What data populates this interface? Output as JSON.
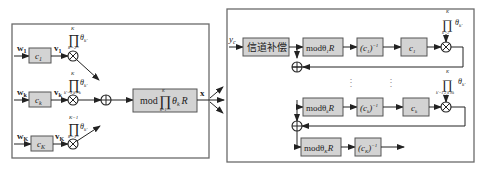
{
  "diagram": {
    "left_panel": {
      "inputs": [
        "w",
        "w",
        "w"
      ],
      "input_subscripts": [
        "1",
        "k",
        "K"
      ],
      "encoders": [
        "c",
        "c",
        "c"
      ],
      "encoder_subscripts": [
        "1",
        "k",
        "K"
      ],
      "outputs": [
        "v",
        "v",
        "v"
      ],
      "output_subscripts": [
        "1",
        "k",
        "K"
      ],
      "products": [
        {
          "top": "K",
          "bottom": "k'=2",
          "symbol": "θ",
          "sub": "k'"
        },
        {
          "top": "K",
          "bottom": "k'=1,k'≠k",
          "symbol": "θ",
          "sub": "k'"
        },
        {
          "top": "K−1",
          "bottom": "k'=1",
          "symbol": "θ",
          "sub": "k'"
        }
      ],
      "mod_block": {
        "prefix": "mod",
        "top": "K",
        "bottom": "k=1",
        "theta": "θ",
        "theta_sub": "k",
        "suffix": "R"
      },
      "output_label": "x"
    },
    "right_panel": {
      "input_label": "y",
      "input_subscript": "c",
      "channel_comp_label": "信道补偿",
      "stage1": {
        "mod": "modθ",
        "mod_sub": "1",
        "mod_suffix": "R",
        "inv": "(c",
        "inv_sub": "1",
        "inv_sup": "−1",
        "enc": "c",
        "enc_sub": "1",
        "prod_top": "K",
        "prod_bottom": "k'=2",
        "prod_theta": "θ",
        "prod_sub": "k'"
      },
      "stagek": {
        "mod": "modθ",
        "mod_sub": "k",
        "mod_suffix": "R",
        "inv": "(c",
        "inv_sub": "k",
        "inv_sup": "−1",
        "enc": "c",
        "enc_sub": "k",
        "prod_top": "K",
        "prod_bottom": "k'=1,2,k'≠k",
        "prod_theta": "θ",
        "prod_sub": "k'"
      },
      "stageK": {
        "mod": "modθ",
        "mod_sub": "K",
        "mod_suffix": "R",
        "inv": "(c",
        "inv_sub": "K",
        "inv_sup": "−1"
      },
      "ellipsis": "⋮"
    }
  }
}
